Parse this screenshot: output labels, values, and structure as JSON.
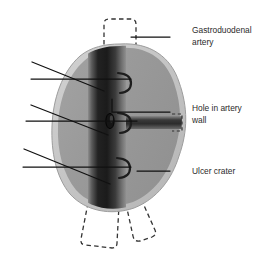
{
  "figure": {
    "type": "medical-anatomical-diagram",
    "background_color": "#ffffff"
  },
  "colors": {
    "organ_body": "#9a9a9a",
    "organ_rim": "#c6c6c6",
    "organ_outline": "#8c8c8c",
    "artery_dark": "#232323",
    "artery_mid": "#4a4a4a",
    "artery_light": "#8f8f8f",
    "hole_fill": "#1a1a1a",
    "leader_line": "#111111",
    "dashed_line": "#333333",
    "text": "#2b2b2b"
  },
  "labels": [
    {
      "id": "gastroduodenal-artery",
      "lines": [
        "Gastroduodenal",
        "artery"
      ],
      "x": 192,
      "y": 30,
      "leader": {
        "x1": 170,
        "y1": 37,
        "x2": 131,
        "y2": 37
      }
    },
    {
      "id": "hole-in-artery-wall",
      "lines": [
        "Hole in artery",
        "wall"
      ],
      "x": 192,
      "y": 108,
      "leader_path": "M 170 112 L 112 112 L 112 98"
    },
    {
      "id": "ulcer-crater",
      "lines": [
        "Ulcer crater"
      ],
      "x": 192,
      "y": 174,
      "leader": {
        "x1": 170,
        "y1": 171,
        "x2": 137,
        "y2": 171
      }
    }
  ],
  "unlabeled_leaders": [
    {
      "id": "leader-pair-1-upper",
      "x1": 32,
      "y1": 62,
      "x2": 104,
      "y2": 91
    },
    {
      "id": "leader-pair-1-lower",
      "x1": 31,
      "y1": 79,
      "x2": 131,
      "y2": 79
    },
    {
      "id": "leader-pair-2-upper",
      "x1": 31,
      "y1": 105,
      "x2": 108,
      "y2": 135
    },
    {
      "id": "leader-pair-2-lower",
      "x1": 26,
      "y1": 121,
      "x2": 137,
      "y2": 121
    },
    {
      "id": "leader-pair-3-upper",
      "x1": 24,
      "y1": 149,
      "x2": 110,
      "y2": 184
    },
    {
      "id": "leader-pair-3-lower",
      "x1": 23,
      "y1": 167,
      "x2": 131,
      "y2": 167
    }
  ],
  "anatomy": {
    "ulcer_crater": {
      "name": "ulcer-crater-mass",
      "description": "irregular rounded crater mass filling the centre of the figure"
    },
    "artery_trunk": {
      "name": "gastroduodenal-artery-trunk",
      "description": "vertical shaded cylindrical artery running top to bottom through the crater"
    },
    "artery_branch_right": {
      "name": "artery-side-branch",
      "description": "horizontal branch leaving the trunk to the right"
    },
    "hole": {
      "name": "hole-in-artery-wall",
      "description": "small dark oval perforation on the anterior artery wall"
    },
    "branch_stubs": [
      {
        "name": "artery-branch-stub-upper"
      },
      {
        "name": "artery-branch-stub-middle"
      },
      {
        "name": "artery-branch-stub-lower"
      }
    ],
    "dashed_continuations": [
      {
        "name": "artery-continuation-top",
        "description": "dashed outline of artery above the crater"
      },
      {
        "name": "artery-continuation-branch-right",
        "description": "small dashed stub at right edge"
      },
      {
        "name": "artery-continuation-bottom-left",
        "description": "dashed artery limb below crater"
      },
      {
        "name": "artery-continuation-bottom-right",
        "description": "dashed bifurcating artery limb below crater"
      }
    ]
  }
}
